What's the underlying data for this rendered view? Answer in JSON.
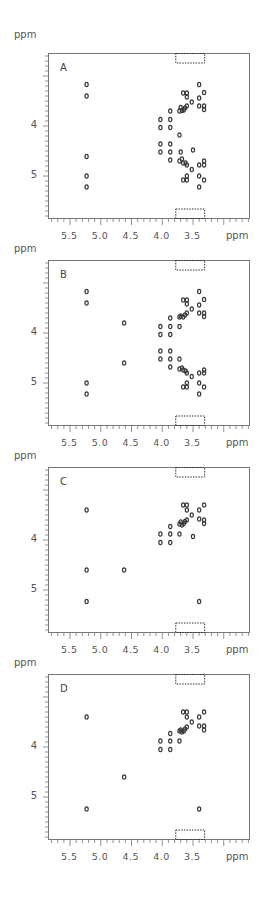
{
  "figure": {
    "axis_unit_label": "ppm",
    "x_tick_labels": [
      "5.5",
      "5.0",
      "4.5",
      "4.0",
      "3.5"
    ],
    "y_tick_labels": [
      "4",
      "5"
    ],
    "colors": {
      "peak": "#3a3a3a",
      "axis": "#777777",
      "text": "#555555",
      "box": "#333333"
    }
  },
  "chart_data": [
    {
      "type": "scatter",
      "title": "A",
      "xlabel": "ppm",
      "ylabel": "ppm",
      "xlim": [
        5.86,
        2.57
      ],
      "ylim": [
        2.54,
        5.86
      ],
      "x_ticks": [
        5.5,
        5.0,
        4.5,
        4.0,
        3.5
      ],
      "y_ticks": [
        4,
        5
      ],
      "dotted_boxes": [
        [
          3.78,
          3.31,
          2.54,
          2.74
        ],
        [
          3.78,
          3.31,
          5.66,
          5.86
        ]
      ],
      "points": [
        [
          5.23,
          3.17
        ],
        [
          5.23,
          3.4
        ],
        [
          5.23,
          4.61
        ],
        [
          5.23,
          5.0
        ],
        [
          5.23,
          5.22
        ],
        [
          4.03,
          3.87
        ],
        [
          4.03,
          4.03
        ],
        [
          4.03,
          4.36
        ],
        [
          4.03,
          4.52
        ],
        [
          3.87,
          3.7
        ],
        [
          3.87,
          3.87
        ],
        [
          3.87,
          4.03
        ],
        [
          3.87,
          4.36
        ],
        [
          3.87,
          4.52
        ],
        [
          3.87,
          4.68
        ],
        [
          3.72,
          3.7
        ],
        [
          3.7,
          3.63
        ],
        [
          3.68,
          3.69
        ],
        [
          3.65,
          3.68
        ],
        [
          3.63,
          3.64
        ],
        [
          3.6,
          3.6
        ],
        [
          3.66,
          3.34
        ],
        [
          3.6,
          3.34
        ],
        [
          3.6,
          3.42
        ],
        [
          3.52,
          3.52
        ],
        [
          3.4,
          3.17
        ],
        [
          3.4,
          3.44
        ],
        [
          3.4,
          3.6
        ],
        [
          3.32,
          3.33
        ],
        [
          3.32,
          3.6
        ],
        [
          3.32,
          3.67
        ],
        [
          3.72,
          4.7
        ],
        [
          3.68,
          4.66
        ],
        [
          3.66,
          4.74
        ],
        [
          3.62,
          4.74
        ],
        [
          3.6,
          4.78
        ],
        [
          3.52,
          4.87
        ],
        [
          3.6,
          5.0
        ],
        [
          3.6,
          5.08
        ],
        [
          3.66,
          5.08
        ],
        [
          3.4,
          4.78
        ],
        [
          3.4,
          5.0
        ],
        [
          3.4,
          5.22
        ],
        [
          3.32,
          4.7
        ],
        [
          3.32,
          4.78
        ],
        [
          3.32,
          5.08
        ],
        [
          3.5,
          4.48
        ],
        [
          3.72,
          4.18
        ],
        [
          3.7,
          4.52
        ]
      ]
    },
    {
      "type": "scatter",
      "title": "B",
      "xlabel": "ppm",
      "ylabel": "ppm",
      "xlim": [
        5.86,
        2.57
      ],
      "ylim": [
        2.54,
        5.86
      ],
      "x_ticks": [
        5.5,
        5.0,
        4.5,
        4.0,
        3.5
      ],
      "y_ticks": [
        4,
        5
      ],
      "dotted_boxes": [
        [
          3.78,
          3.31,
          2.54,
          2.74
        ],
        [
          3.78,
          3.31,
          5.66,
          5.86
        ]
      ],
      "points": [
        [
          5.23,
          3.17
        ],
        [
          5.23,
          3.4
        ],
        [
          5.23,
          5.0
        ],
        [
          5.23,
          5.22
        ],
        [
          4.62,
          3.8
        ],
        [
          4.62,
          4.6
        ],
        [
          4.03,
          3.87
        ],
        [
          4.03,
          4.03
        ],
        [
          4.03,
          4.36
        ],
        [
          4.03,
          4.52
        ],
        [
          3.87,
          3.7
        ],
        [
          3.87,
          3.87
        ],
        [
          3.87,
          4.03
        ],
        [
          3.87,
          4.36
        ],
        [
          3.87,
          4.52
        ],
        [
          3.87,
          4.68
        ],
        [
          3.72,
          3.68
        ],
        [
          3.7,
          3.66
        ],
        [
          3.66,
          3.68
        ],
        [
          3.63,
          3.64
        ],
        [
          3.6,
          3.6
        ],
        [
          3.72,
          3.87
        ],
        [
          3.66,
          3.34
        ],
        [
          3.6,
          3.34
        ],
        [
          3.6,
          3.42
        ],
        [
          3.52,
          3.52
        ],
        [
          3.4,
          3.17
        ],
        [
          3.4,
          3.44
        ],
        [
          3.4,
          3.6
        ],
        [
          3.32,
          3.33
        ],
        [
          3.32,
          3.6
        ],
        [
          3.32,
          3.67
        ],
        [
          3.72,
          4.72
        ],
        [
          3.68,
          4.7
        ],
        [
          3.66,
          4.74
        ],
        [
          3.62,
          4.76
        ],
        [
          3.6,
          4.8
        ],
        [
          3.52,
          4.87
        ],
        [
          3.6,
          5.0
        ],
        [
          3.6,
          5.08
        ],
        [
          3.66,
          5.08
        ],
        [
          3.4,
          4.8
        ],
        [
          3.4,
          5.0
        ],
        [
          3.4,
          5.22
        ],
        [
          3.32,
          4.74
        ],
        [
          3.32,
          4.8
        ],
        [
          3.32,
          5.08
        ],
        [
          3.72,
          4.52
        ]
      ]
    },
    {
      "type": "scatter",
      "title": "C",
      "xlabel": "ppm",
      "ylabel": "ppm",
      "xlim": [
        5.86,
        2.57
      ],
      "ylim": [
        2.54,
        5.86
      ],
      "x_ticks": [
        5.5,
        5.0,
        4.5,
        4.0,
        3.5
      ],
      "y_ticks": [
        4,
        5
      ],
      "dotted_boxes": [
        [
          3.78,
          3.31,
          2.54,
          2.74
        ],
        [
          3.78,
          3.31,
          5.66,
          5.86
        ]
      ],
      "points": [
        [
          5.23,
          3.4
        ],
        [
          5.23,
          4.6
        ],
        [
          5.23,
          5.23
        ],
        [
          4.62,
          4.6
        ],
        [
          4.03,
          3.88
        ],
        [
          4.03,
          4.05
        ],
        [
          3.87,
          3.73
        ],
        [
          3.87,
          3.88
        ],
        [
          3.87,
          4.05
        ],
        [
          3.72,
          3.68
        ],
        [
          3.7,
          3.64
        ],
        [
          3.68,
          3.7
        ],
        [
          3.65,
          3.67
        ],
        [
          3.63,
          3.63
        ],
        [
          3.6,
          3.6
        ],
        [
          3.72,
          3.88
        ],
        [
          3.66,
          3.3
        ],
        [
          3.6,
          3.3
        ],
        [
          3.6,
          3.4
        ],
        [
          3.52,
          3.5
        ],
        [
          3.4,
          3.4
        ],
        [
          3.4,
          3.58
        ],
        [
          3.32,
          3.3
        ],
        [
          3.32,
          3.6
        ],
        [
          3.32,
          3.67
        ],
        [
          3.5,
          3.93
        ],
        [
          3.4,
          5.23
        ]
      ]
    },
    {
      "type": "scatter",
      "title": "D",
      "xlabel": "ppm",
      "ylabel": "ppm",
      "xlim": [
        5.86,
        2.57
      ],
      "ylim": [
        2.54,
        5.86
      ],
      "x_ticks": [
        5.5,
        5.0,
        4.5,
        4.0,
        3.5
      ],
      "y_ticks": [
        4,
        5
      ],
      "dotted_boxes": [
        [
          3.78,
          3.31,
          2.54,
          2.74
        ],
        [
          3.78,
          3.31,
          5.66,
          5.86
        ]
      ],
      "points": [
        [
          5.23,
          3.4
        ],
        [
          5.23,
          5.24
        ],
        [
          4.62,
          4.6
        ],
        [
          4.03,
          3.88
        ],
        [
          4.03,
          4.05
        ],
        [
          3.87,
          3.73
        ],
        [
          3.87,
          3.88
        ],
        [
          3.87,
          4.05
        ],
        [
          3.72,
          3.68
        ],
        [
          3.7,
          3.66
        ],
        [
          3.68,
          3.7
        ],
        [
          3.65,
          3.68
        ],
        [
          3.63,
          3.64
        ],
        [
          3.6,
          3.6
        ],
        [
          3.72,
          3.88
        ],
        [
          3.66,
          3.3
        ],
        [
          3.6,
          3.3
        ],
        [
          3.6,
          3.4
        ],
        [
          3.52,
          3.5
        ],
        [
          3.4,
          3.4
        ],
        [
          3.4,
          3.58
        ],
        [
          3.32,
          3.3
        ],
        [
          3.32,
          3.58
        ],
        [
          3.32,
          3.66
        ],
        [
          3.4,
          5.24
        ]
      ]
    }
  ]
}
